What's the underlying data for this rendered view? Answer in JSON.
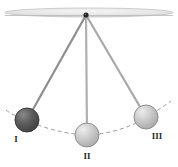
{
  "figure": {
    "name": "simple-pendulum-three-positions",
    "width": 178,
    "height": 167,
    "background_color": "#ffffff"
  },
  "ceiling": {
    "name": "ceiling-support-bar",
    "center_x": 89,
    "center_y": 12.5,
    "width": 168,
    "height": 9,
    "fill_color": "#e8e8e8",
    "edge_color": "#bdbdbd"
  },
  "pivot": {
    "name": "pivot-point",
    "x": 86,
    "y": 15,
    "radius": 2.6,
    "color": "#2a2a2a"
  },
  "arc": {
    "name": "swing-path-arc",
    "color": "#9a9a9a",
    "dash": "4,3",
    "width": 1,
    "path": "M 6 110 Q 12 115 27 120.5 Q 56 133.5 87 135 Q 120 133.5 146 117.5 Q 160 109 171 101"
  },
  "strings": [
    {
      "name": "string-position-I",
      "x1": 86,
      "y1": 15,
      "x2": 27,
      "y2": 120,
      "color": "#8e8e8e",
      "width": 2.2
    },
    {
      "name": "string-position-II",
      "x1": 86,
      "y1": 15,
      "x2": 87,
      "y2": 135,
      "color": "#b0b0b0",
      "width": 2.2
    },
    {
      "name": "string-position-III",
      "x1": 86,
      "y1": 15,
      "x2": 146,
      "y2": 117,
      "color": "#a8a8a8",
      "width": 2.2
    }
  ],
  "bobs": [
    {
      "name": "bob-I",
      "label": "I",
      "cx": 27,
      "cy": 120,
      "r": 12,
      "fill_light": "#8a8a8a",
      "fill_mid": "#5f5f5f",
      "fill_dark": "#4a4a4a",
      "edge_color": "#3c3c3c",
      "label_x": 16,
      "label_y": 142
    },
    {
      "name": "bob-II",
      "label": "II",
      "cx": 87,
      "cy": 135,
      "r": 12,
      "fill_light": "#e2e2e2",
      "fill_mid": "#c6c6c6",
      "fill_dark": "#b0b0b0",
      "edge_color": "#909090",
      "label_x": 87,
      "label_y": 159
    },
    {
      "name": "bob-III",
      "label": "III",
      "cx": 146,
      "cy": 117,
      "r": 12,
      "fill_light": "#e0e0e0",
      "fill_mid": "#c4c4c4",
      "fill_dark": "#aeaeae",
      "edge_color": "#8e8e8e",
      "label_x": 157,
      "label_y": 139
    }
  ]
}
